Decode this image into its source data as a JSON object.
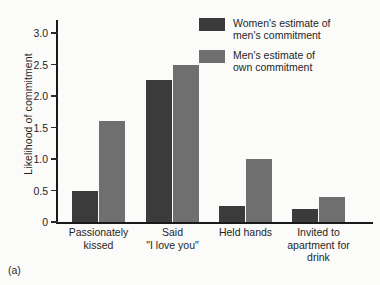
{
  "panel_label": "(a)",
  "chart_data": {
    "type": "bar",
    "title": "",
    "xlabel": "",
    "ylabel": "Likelihood of commitment",
    "ylim": [
      0,
      3.0
    ],
    "ytick_labels": [
      "3.0",
      "2.5",
      "2.0",
      "1.5",
      "1.0",
      "0.5",
      "0"
    ],
    "yticks": [
      3.0,
      2.5,
      2.0,
      1.5,
      1.0,
      0.5,
      0
    ],
    "grid": false,
    "legend_position": "top-right",
    "categories": [
      "Passionately\nkissed",
      "Said\n\"I love you\"",
      "Held hands",
      "Invited to\napartment for\ndrink"
    ],
    "series": [
      {
        "name": "Women's estimate of\nmen's commitment",
        "color": "#3b3b3b",
        "values": [
          0.5,
          2.25,
          0.25,
          0.2
        ]
      },
      {
        "name": "Men's estimate of\nown commitment",
        "color": "#6f6f6f",
        "values": [
          1.6,
          2.5,
          1.0,
          0.4
        ]
      }
    ]
  }
}
